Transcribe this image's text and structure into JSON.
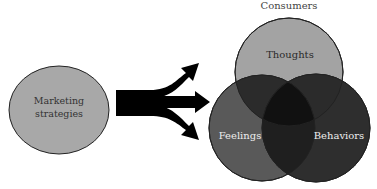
{
  "title": "Consumers",
  "source": {
    "label_line1": "Marketing",
    "label_line2": "strategies",
    "fill": "#a8a8a8"
  },
  "arrows": {
    "count": 3,
    "color": "#000000"
  },
  "venn": {
    "circles": [
      {
        "id": "thoughts",
        "label": "Thoughts",
        "fill": "#a3a3a3",
        "text_color": "#2a2a2a"
      },
      {
        "id": "feelings",
        "label": "Feelings",
        "fill": "#555555",
        "text_color": "#eeeeee"
      },
      {
        "id": "behaviors",
        "label": "Behaviors",
        "fill": "#2e2e2e",
        "text_color": "#eeeeee"
      }
    ]
  }
}
